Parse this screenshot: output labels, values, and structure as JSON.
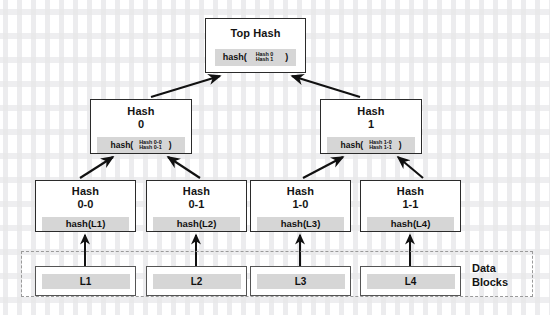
{
  "diagram": {
    "colors": {
      "node_border": "#2b2b2b",
      "band_fill": "#d6d6d6",
      "dashed_border": "#9a9a9a",
      "arrow": "#111111",
      "background": "#ffffff"
    },
    "root": {
      "title": "Top Hash",
      "formula_open": "hash(",
      "formula_args": [
        "Hash 0",
        "Hash 1"
      ],
      "formula_close": ")"
    },
    "level1": [
      {
        "title_line1": "Hash",
        "title_line2": "0",
        "formula_open": "hash(",
        "formula_args": [
          "Hash 0-0",
          "Hash 0-1"
        ],
        "formula_close": ")"
      },
      {
        "title_line1": "Hash",
        "title_line2": "1",
        "formula_open": "hash(",
        "formula_args": [
          "Hash 1-0",
          "Hash 1-1"
        ],
        "formula_close": ")"
      }
    ],
    "leaves": [
      {
        "title_line1": "Hash",
        "title_line2": "0-0",
        "formula": "hash(L1)"
      },
      {
        "title_line1": "Hash",
        "title_line2": "0-1",
        "formula": "hash(L2)"
      },
      {
        "title_line1": "Hash",
        "title_line2": "1-0",
        "formula": "hash(L3)"
      },
      {
        "title_line1": "Hash",
        "title_line2": "1-1",
        "formula": "hash(L4)"
      }
    ],
    "data_blocks": {
      "label_line1": "Data",
      "label_line2": "Blocks",
      "blocks": [
        "L1",
        "L2",
        "L3",
        "L4"
      ]
    }
  }
}
